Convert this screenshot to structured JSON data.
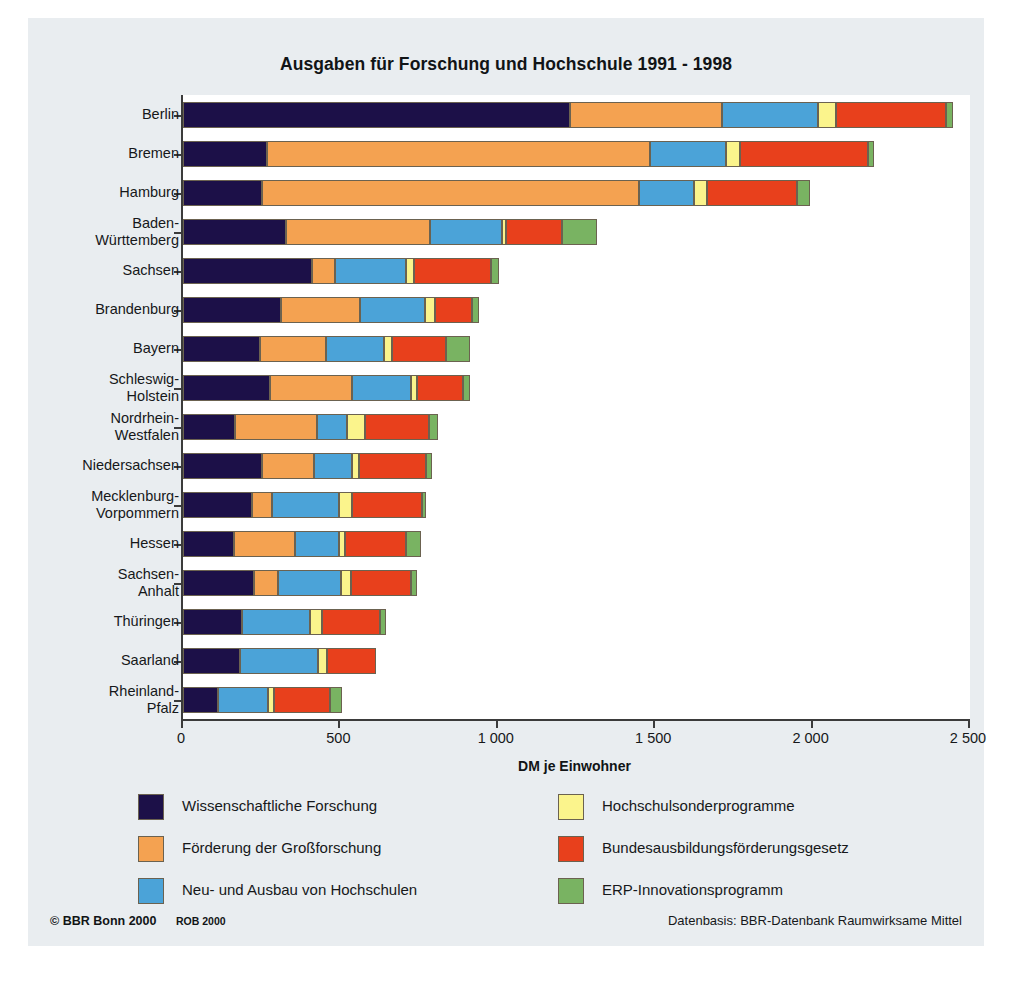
{
  "figure": {
    "title": "Ausgaben für Forschung und Hochschule 1991 - 1998",
    "copyright": "© BBR Bonn 2000",
    "rob": "ROB 2000",
    "datenbasis": "Datenbasis: BBR-Datenbank Raumwirksame Mittel"
  },
  "chart_data": {
    "type": "bar",
    "orientation": "horizontal",
    "stacked": true,
    "title": "Ausgaben für Forschung und Hochschule 1991 - 1998",
    "xlabel": "DM je Einwohner",
    "ylabel": "",
    "xlim": [
      0,
      2500
    ],
    "xticks": [
      0,
      500,
      1000,
      1500,
      2000,
      2500
    ],
    "xticklabels": [
      "0",
      "500",
      "1 000",
      "1 500",
      "2 000",
      "2 500"
    ],
    "grid": false,
    "legend_position": "below",
    "categories": [
      "Berlin",
      "Bremen",
      "Hamburg",
      "Baden-Württemberg",
      "Sachsen",
      "Brandenburg",
      "Bayern",
      "Schleswig-Holstein",
      "Nordrhein-Westfalen",
      "Niedersachsen",
      "Mecklenburg-Vorpommern",
      "Hessen",
      "Sachsen-Anhalt",
      "Thüringen",
      "Saarland",
      "Rheinland-Pfalz"
    ],
    "category_labels": [
      [
        "Berlin"
      ],
      [
        "Bremen"
      ],
      [
        "Hamburg"
      ],
      [
        "Baden-",
        "Württemberg"
      ],
      [
        "Sachsen"
      ],
      [
        "Brandenburg"
      ],
      [
        "Bayern"
      ],
      [
        "Schleswig-",
        "Holstein"
      ],
      [
        "Nordrhein-",
        "Westfalen"
      ],
      [
        "Niedersachsen"
      ],
      [
        "Mecklenburg-",
        "Vorpommern"
      ],
      [
        "Hessen"
      ],
      [
        "Sachsen-",
        "Anhalt"
      ],
      [
        "Thüringen"
      ],
      [
        "Saarland"
      ],
      [
        "Rheinland-",
        "Pfalz"
      ]
    ],
    "series": [
      {
        "name": "Wissenschaftliche Forschung",
        "color": "#1c1048",
        "values": [
          1230,
          267,
          251,
          327,
          410,
          311,
          245,
          276,
          165,
          251,
          219,
          162,
          226,
          187,
          181,
          111
        ]
      },
      {
        "name": "Förderung der Großforschung",
        "color": "#f4a251",
        "values": [
          483,
          1217,
          1198,
          458,
          73,
          251,
          210,
          260,
          260,
          165,
          64,
          194,
          76,
          0,
          0,
          0
        ]
      },
      {
        "name": "Neu- und Ausbau von Hochschulen",
        "color": "#4ba3d8",
        "values": [
          305,
          241,
          175,
          229,
          226,
          207,
          184,
          187,
          95,
          121,
          213,
          140,
          200,
          216,
          248,
          159
        ]
      },
      {
        "name": "Hochschulsonderprogramme",
        "color": "#fbf48c",
        "values": [
          57,
          45,
          41,
          12,
          25,
          32,
          25,
          19,
          57,
          22,
          41,
          19,
          32,
          38,
          29,
          19
        ]
      },
      {
        "name": "Bundesausbildungsförderungsgesetz",
        "color": "#e8401c",
        "values": [
          350,
          406,
          286,
          178,
          245,
          118,
          172,
          149,
          203,
          213,
          222,
          194,
          191,
          184,
          156,
          178
        ]
      },
      {
        "name": "ERP-Innovationsprogramm",
        "color": "#79b362",
        "values": [
          22,
          20,
          41,
          111,
          25,
          22,
          76,
          22,
          29,
          19,
          13,
          48,
          19,
          19,
          0,
          38
        ]
      }
    ],
    "totals": [
      2447,
      2196,
      1992,
      1315,
      1004,
      941,
      912,
      913,
      809,
      791,
      772,
      757,
      744,
      644,
      614,
      505
    ]
  },
  "legend": [
    {
      "label": "Wissenschaftliche Forschung",
      "color": "#1c1048"
    },
    {
      "label": "Hochschulsonderprogramme",
      "color": "#fbf48c"
    },
    {
      "label": "Förderung der Großforschung",
      "color": "#f4a251"
    },
    {
      "label": "Bundesausbildungsförderungsgesetz",
      "color": "#e8401c"
    },
    {
      "label": "Neu- und Ausbau von Hochschulen",
      "color": "#4ba3d8"
    },
    {
      "label": "ERP-Innovationsprogramm",
      "color": "#79b362"
    }
  ]
}
